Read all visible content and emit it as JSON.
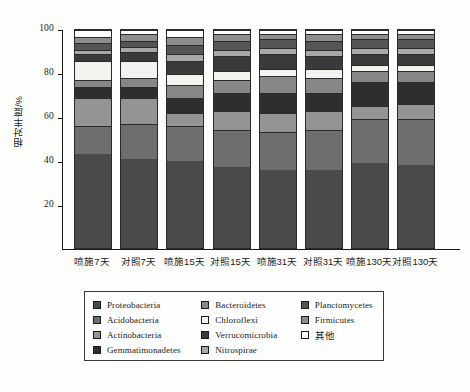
{
  "axis": {
    "ylabel": "相对丰度/%",
    "yticks": [
      "100",
      "80",
      "60",
      "40",
      "20"
    ],
    "ylim": [
      0,
      100
    ],
    "xticklabels": [
      "喷施7天",
      "对照7天",
      "喷施15天",
      "对照15天",
      "喷施31天",
      "对照31天",
      "喷施130天",
      "对照130天"
    ]
  },
  "legend": {
    "columns": [
      [
        {
          "label": "Proteobacteria",
          "color": "#4a4a4a"
        },
        {
          "label": "Acidobacteria",
          "color": "#6e6e6e"
        },
        {
          "label": "Actinobacteria",
          "color": "#949494"
        },
        {
          "label": "Gemmatimonadetes",
          "color": "#2e2e2e"
        }
      ],
      [
        {
          "label": "Bacteroidetes",
          "color": "#878787"
        },
        {
          "label": "Chloroflexi",
          "color": "#f2f2ee"
        },
        {
          "label": "Verrucomicrobia",
          "color": "#3a3a3a"
        },
        {
          "label": "Nitrospirae",
          "color": "#a8a8a8"
        }
      ],
      [
        {
          "label": "Planctomycetes",
          "color": "#555555"
        },
        {
          "label": "Firmicutes",
          "color": "#8e8e8e"
        },
        {
          "label": "其他",
          "color": "#ffffff"
        }
      ]
    ]
  },
  "chart_data": {
    "type": "bar",
    "stacked": true,
    "title": "",
    "xlabel": "",
    "ylabel": "相对丰度/%",
    "ylim": [
      0,
      100
    ],
    "grid": false,
    "legend_position": "bottom",
    "categories": [
      "喷施7天",
      "对照7天",
      "喷施15天",
      "对照15天",
      "喷施31天",
      "对照31天",
      "喷施130天",
      "对照130天"
    ],
    "series": [
      {
        "name": "Proteobacteria",
        "color": "#4a4a4a",
        "values": [
          43,
          41,
          40,
          37,
          36,
          36,
          39,
          38
        ]
      },
      {
        "name": "Acidobacteria",
        "color": "#6e6e6e",
        "values": [
          13,
          16,
          16,
          17,
          17,
          18,
          20,
          21
        ]
      },
      {
        "name": "Actinobacteria",
        "color": "#949494",
        "values": [
          13,
          12,
          6,
          9,
          9,
          9,
          6,
          7
        ]
      },
      {
        "name": "Gemmatimonadetes",
        "color": "#2e2e2e",
        "values": [
          5,
          5,
          7,
          8,
          9,
          8,
          11,
          10
        ]
      },
      {
        "name": "Bacteroidetes",
        "color": "#878787",
        "values": [
          3,
          4,
          6,
          6,
          8,
          7,
          5,
          5
        ]
      },
      {
        "name": "Chloroflexi",
        "color": "#f2f2ee",
        "values": [
          9,
          8,
          5,
          4,
          3,
          4,
          3,
          3
        ]
      },
      {
        "name": "Verrucomicrobia",
        "color": "#3a3a3a",
        "values": [
          3,
          4,
          6,
          7,
          7,
          6,
          5,
          5
        ]
      },
      {
        "name": "Nitrospirae",
        "color": "#a8a8a8",
        "values": [
          2,
          2,
          3,
          3,
          3,
          3,
          3,
          3
        ]
      },
      {
        "name": "Planctomycetes",
        "color": "#555555",
        "values": [
          3,
          3,
          4,
          4,
          4,
          4,
          4,
          4
        ]
      },
      {
        "name": "Firmicutes",
        "color": "#8e8e8e",
        "values": [
          3,
          3,
          4,
          3,
          2,
          3,
          2,
          2
        ]
      },
      {
        "name": "其他",
        "color": "#ffffff",
        "values": [
          3,
          2,
          3,
          2,
          2,
          2,
          2,
          2
        ]
      }
    ]
  }
}
